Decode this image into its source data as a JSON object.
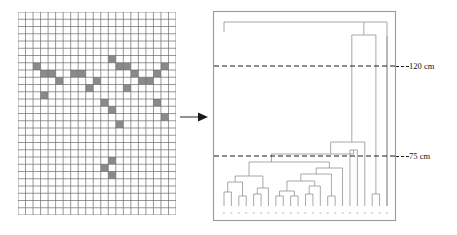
{
  "figure": {
    "title": "",
    "panels": [
      "species-occurrence-grid",
      "cluster-dendrogram"
    ],
    "arrow_icon": "arrow-right-icon"
  },
  "grid": {
    "name": "species-occurrence-grid",
    "cols": 21,
    "rows": 28,
    "cell_px": 7.3,
    "line_color": "#6b6b6b",
    "fill_color": "#8a8a8a",
    "background": "#ffffff",
    "filled_cells": [
      [
        2,
        7
      ],
      [
        12,
        6
      ],
      [
        13,
        7
      ],
      [
        14,
        7
      ],
      [
        19,
        7
      ],
      [
        3,
        8
      ],
      [
        4,
        8
      ],
      [
        7,
        8
      ],
      [
        8,
        8
      ],
      [
        15,
        8
      ],
      [
        18,
        8
      ],
      [
        5,
        9
      ],
      [
        10,
        9
      ],
      [
        16,
        9
      ],
      [
        17,
        9
      ],
      [
        9,
        10
      ],
      [
        14,
        10
      ],
      [
        3,
        11
      ],
      [
        11,
        12
      ],
      [
        12,
        13
      ],
      [
        18,
        12
      ],
      [
        19,
        14
      ],
      [
        13,
        15
      ],
      [
        12,
        20
      ],
      [
        11,
        21
      ],
      [
        12,
        22
      ]
    ]
  },
  "dendrogram": {
    "name": "cluster-dendrogram",
    "frame_color": "#9a9a9a",
    "line_color": "#8c8c8c",
    "n_leaves": 23,
    "axis": {
      "unit": "cm",
      "direction": "height-increases-upward"
    },
    "cut_lines": [
      {
        "name": "cut-line-120",
        "label": "120 cm",
        "y_px": 66,
        "style": "dashed"
      },
      {
        "name": "cut-line-75",
        "label": "75 cm",
        "y_px": 156,
        "style": "dashed"
      }
    ],
    "merges": [
      {
        "id": "root",
        "height_px": 25,
        "x1": 140,
        "x2": 172
      },
      {
        "id": "m-b",
        "height_px": 138,
        "x1": 122,
        "x2": 155
      },
      {
        "id": "m-c",
        "height_px": 151,
        "x1": 98,
        "x2": 140
      },
      {
        "id": "m-d",
        "height_px": 160,
        "x1": 18,
        "x2": 122
      },
      {
        "id": "m-e",
        "height_px": 172,
        "x1": 8,
        "x2": 30
      },
      {
        "id": "m-f",
        "height_px": 178,
        "x1": 110,
        "x2": 135
      }
    ],
    "leaf_label_text": "unreadable-micro-labels"
  },
  "labels": {
    "cut_120": "120 cm",
    "cut_75": "75 cm"
  }
}
